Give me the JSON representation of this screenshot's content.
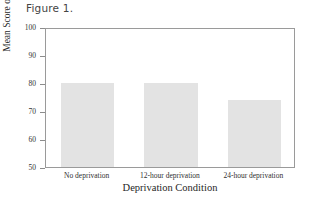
{
  "figure": {
    "caption": "Figure 1."
  },
  "chart_data": {
    "type": "bar",
    "title": "Figure 1.",
    "categories": [
      "No deprivation",
      "12-hour deprivation",
      "24-hour deprivation"
    ],
    "values": [
      80,
      80,
      74
    ],
    "xlabel": "Deprivation Condition",
    "ylabel": "Mean Score on Concentration Test",
    "ylim": [
      50,
      100
    ],
    "yticks": [
      50,
      60,
      70,
      80,
      90,
      100
    ],
    "ytick_labels": [
      "50",
      "60",
      "70",
      "80",
      "90",
      "100"
    ],
    "grid": false,
    "legend": null,
    "bar_color": "#e3e3e3",
    "frame_color": "#9a9a9a",
    "background": "#ffffff"
  }
}
